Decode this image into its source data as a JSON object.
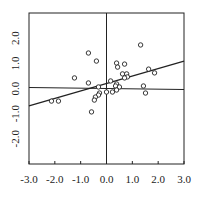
{
  "chart_data": {
    "type": "scatter",
    "title": "",
    "xlabel": "",
    "ylabel": "",
    "xlim": [
      -3.0,
      3.0
    ],
    "ylim": [
      -3.0,
      3.0
    ],
    "grid": false,
    "legend": null,
    "x_ticks": [
      "-3.0",
      "-2.0",
      "-1.0",
      "0.0",
      "1.0",
      "2.0",
      "3.0"
    ],
    "y_ticks": [
      "2.0",
      "1.0",
      "0.0",
      "-1.0",
      "-2.0"
    ],
    "reference_lines": {
      "x_zero": 0.0,
      "y_zero": 0.0
    },
    "regression_line": {
      "x": [
        -3.0,
        3.0
      ],
      "y": [
        -0.69,
        1.09
      ]
    },
    "points": [
      {
        "x": -2.13,
        "y": -0.5
      },
      {
        "x": -1.86,
        "y": -0.5
      },
      {
        "x": -1.24,
        "y": 0.42
      },
      {
        "x": -0.7,
        "y": 1.41
      },
      {
        "x": -0.39,
        "y": 1.09
      },
      {
        "x": -0.7,
        "y": 0.22
      },
      {
        "x": -0.31,
        "y": 0.06
      },
      {
        "x": -0.27,
        "y": -0.18
      },
      {
        "x": -0.31,
        "y": -0.26
      },
      {
        "x": -0.43,
        "y": -0.34
      },
      {
        "x": -0.47,
        "y": -0.46
      },
      {
        "x": -0.58,
        "y": -0.93
      },
      {
        "x": 0.0,
        "y": -0.14
      },
      {
        "x": 1.32,
        "y": 1.73
      },
      {
        "x": 0.39,
        "y": 1.01
      },
      {
        "x": 0.43,
        "y": 0.85
      },
      {
        "x": 0.7,
        "y": 0.97
      },
      {
        "x": 0.62,
        "y": 0.58
      },
      {
        "x": 0.78,
        "y": 0.58
      },
      {
        "x": 0.81,
        "y": 0.46
      },
      {
        "x": 0.7,
        "y": 0.42
      },
      {
        "x": 0.16,
        "y": 0.3
      },
      {
        "x": 0.39,
        "y": 0.18
      },
      {
        "x": 0.35,
        "y": 0.1
      },
      {
        "x": 0.5,
        "y": 0.06
      },
      {
        "x": 1.63,
        "y": 0.77
      },
      {
        "x": 1.86,
        "y": 0.62
      },
      {
        "x": 1.43,
        "y": 0.1
      },
      {
        "x": 1.51,
        "y": -0.18
      },
      {
        "x": 0.23,
        "y": -0.14
      },
      {
        "x": 0.39,
        "y": -0.06
      }
    ]
  },
  "style": {
    "stroke_color": "#222222",
    "point_fill": "#ffffff"
  }
}
